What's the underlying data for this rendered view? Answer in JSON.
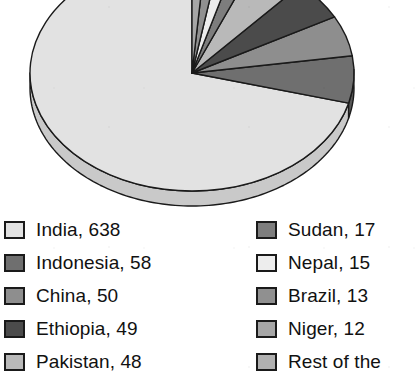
{
  "chart_data": {
    "type": "pie",
    "title": "",
    "subtitle": "",
    "xlabel": "",
    "ylabel": "",
    "legend_position": "bottom",
    "three_d": true,
    "value_suffix": "",
    "total_labeled": 900,
    "categories": [
      "India",
      "Indonesia",
      "China",
      "Ethiopia",
      "Pakistan",
      "Sudan",
      "Nepal",
      "Brazil",
      "Niger",
      "Rest of the"
    ],
    "values": [
      638,
      58,
      50,
      49,
      48,
      17,
      15,
      13,
      12,
      0
    ],
    "slices": [
      {
        "label": "India",
        "value": 638,
        "legend_text": "India, 638",
        "color": "#e2e2e2",
        "side_color": "#c9c9c9"
      },
      {
        "label": "Indonesia",
        "value": 58,
        "legend_text": "Indonesia, 58",
        "color": "#6f6f6f",
        "side_color": "#585858"
      },
      {
        "label": "China",
        "value": 50,
        "legend_text": "China, 50",
        "color": "#8e8e8e",
        "side_color": "#747474"
      },
      {
        "label": "Ethiopia",
        "value": 49,
        "legend_text": "Ethiopia, 49",
        "color": "#4b4b4b",
        "side_color": "#3a3a3a"
      },
      {
        "label": "Pakistan",
        "value": 48,
        "legend_text": "Pakistan, 48",
        "color": "#b9b9b9",
        "side_color": "#9d9d9d"
      },
      {
        "label": "Sudan",
        "value": 17,
        "legend_text": "Sudan, 17",
        "color": "#7d7d7d",
        "side_color": "#656565"
      },
      {
        "label": "Nepal",
        "value": 15,
        "legend_text": "Nepal, 15",
        "color": "#ededed",
        "side_color": "#d2d2d2"
      },
      {
        "label": "Brazil",
        "value": 13,
        "legend_text": "Brazil, 13",
        "color": "#909090",
        "side_color": "#767676"
      },
      {
        "label": "Niger",
        "value": 12,
        "legend_text": "Niger, 12",
        "color": "#a6a6a6",
        "side_color": "#8a8a8a"
      },
      {
        "label": "Rest of the",
        "value": 0,
        "legend_text": "Rest of the",
        "color": "#b0b0b0",
        "side_color": "#959595"
      }
    ]
  },
  "legend": {
    "left_column": [
      {
        "text": "India, 638",
        "color": "#e2e2e2"
      },
      {
        "text": "Indonesia, 58",
        "color": "#6f6f6f"
      },
      {
        "text": "China, 50",
        "color": "#8e8e8e"
      },
      {
        "text": "Ethiopia, 49",
        "color": "#4b4b4b"
      },
      {
        "text": "Pakistan, 48",
        "color": "#b9b9b9"
      }
    ],
    "right_column": [
      {
        "text": "Sudan, 17",
        "color": "#7d7d7d"
      },
      {
        "text": "Nepal, 15",
        "color": "#ededed"
      },
      {
        "text": "Brazil, 13",
        "color": "#909090"
      },
      {
        "text": "Niger, 12",
        "color": "#a6a6a6"
      },
      {
        "text": "Rest of the",
        "color": "#b0b0b0"
      }
    ]
  },
  "geometry": {
    "center_x": 192,
    "center_y": 73,
    "radius_x": 162,
    "radius_y": 118,
    "depth": 15,
    "start_angle_deg": -90,
    "direction": "counterclockwise",
    "outline_color": "#1a1a1a"
  },
  "colors": {
    "background": "#ffffff",
    "text": "#111111",
    "outline": "#1a1a1a"
  }
}
